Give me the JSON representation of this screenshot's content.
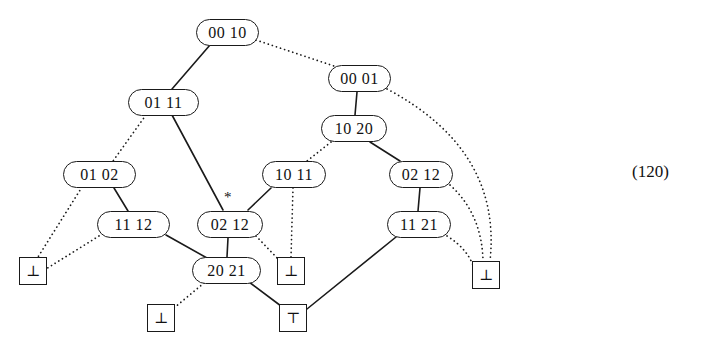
{
  "figure": {
    "equation_number": "(120)",
    "star_annotation": "*",
    "colors": {
      "background": "#ffffff",
      "ink": "#111111",
      "stroke": "#1a1a1a"
    },
    "nodes": [
      {
        "id": "n_00_10",
        "label": "00 10",
        "x": 196,
        "y": 19,
        "w": 63,
        "h": 27,
        "font_size": 16
      },
      {
        "id": "n_01_11",
        "label": "01 11",
        "x": 128,
        "y": 89,
        "w": 71,
        "h": 27,
        "font_size": 16
      },
      {
        "id": "n_00_01",
        "label": "00 01",
        "x": 328,
        "y": 65,
        "w": 63,
        "h": 27,
        "font_size": 16
      },
      {
        "id": "n_10_20",
        "label": "10 20",
        "x": 321,
        "y": 115,
        "w": 66,
        "h": 27,
        "font_size": 16
      },
      {
        "id": "n_01_02",
        "label": "01 02",
        "x": 63,
        "y": 161,
        "w": 73,
        "h": 27,
        "font_size": 16
      },
      {
        "id": "n_10_11",
        "label": "10 11",
        "x": 262,
        "y": 161,
        "w": 64,
        "h": 27,
        "font_size": 16
      },
      {
        "id": "n_02_12_r",
        "label": "02 12",
        "x": 389,
        "y": 161,
        "w": 64,
        "h": 27,
        "font_size": 16
      },
      {
        "id": "n_11_12",
        "label": "11 12",
        "x": 97,
        "y": 211,
        "w": 73,
        "h": 27,
        "font_size": 16
      },
      {
        "id": "n_02_12_l",
        "label": "02 12",
        "x": 197,
        "y": 211,
        "w": 66,
        "h": 27,
        "font_size": 16
      },
      {
        "id": "n_11_21",
        "label": "11 21",
        "x": 387,
        "y": 211,
        "w": 64,
        "h": 27,
        "font_size": 16
      },
      {
        "id": "n_20_21",
        "label": "20 21",
        "x": 192,
        "y": 257,
        "w": 69,
        "h": 27,
        "font_size": 16
      }
    ],
    "terminals": [
      {
        "id": "t_bot_1",
        "label": "⊥",
        "x": 19,
        "y": 257,
        "w": 28,
        "h": 28,
        "font_size": 15
      },
      {
        "id": "t_bot_2",
        "label": "⊥",
        "x": 277,
        "y": 257,
        "w": 28,
        "h": 28,
        "font_size": 15
      },
      {
        "id": "t_bot_3",
        "label": "⊥",
        "x": 472,
        "y": 261,
        "w": 28,
        "h": 28,
        "font_size": 15
      },
      {
        "id": "t_bot_4",
        "label": "⊥",
        "x": 147,
        "y": 304,
        "w": 28,
        "h": 28,
        "font_size": 15
      },
      {
        "id": "t_top_1",
        "label": "⊤",
        "x": 279,
        "y": 304,
        "w": 28,
        "h": 28,
        "font_size": 15
      }
    ],
    "edges": [
      {
        "from": "n_00_10",
        "to": "n_01_11",
        "style": "solid",
        "kind": "line",
        "x1": 210,
        "y1": 45,
        "x2": 172,
        "y2": 89
      },
      {
        "from": "n_00_10",
        "to": "n_00_01",
        "style": "dotted",
        "kind": "line",
        "x1": 256,
        "y1": 40,
        "x2": 334,
        "y2": 66
      },
      {
        "from": "n_01_11",
        "to": "n_01_02",
        "style": "dotted",
        "kind": "line",
        "x1": 146,
        "y1": 115,
        "x2": 113,
        "y2": 161
      },
      {
        "from": "n_01_11",
        "to": "n_02_12_l",
        "style": "solid",
        "kind": "line",
        "x1": 172,
        "y1": 115,
        "x2": 223,
        "y2": 210
      },
      {
        "from": "n_00_01",
        "to": "n_10_20",
        "style": "solid",
        "kind": "line",
        "x1": 357,
        "y1": 92,
        "x2": 355,
        "y2": 115
      },
      {
        "from": "n_00_01",
        "to": "t_bot_3",
        "style": "dotted",
        "kind": "curve",
        "x1": 387,
        "y1": 89,
        "cx": 502,
        "cy": 150,
        "x2": 490,
        "y2": 261
      },
      {
        "from": "n_10_20",
        "to": "n_10_11",
        "style": "dotted",
        "kind": "line",
        "x1": 331,
        "y1": 142,
        "x2": 307,
        "y2": 161
      },
      {
        "from": "n_10_20",
        "to": "n_02_12_r",
        "style": "solid",
        "kind": "line",
        "x1": 370,
        "y1": 142,
        "x2": 400,
        "y2": 161
      },
      {
        "from": "n_01_02",
        "to": "t_bot_1",
        "style": "dotted",
        "kind": "line",
        "x1": 82,
        "y1": 187,
        "x2": 38,
        "y2": 257
      },
      {
        "from": "n_01_02",
        "to": "n_11_12",
        "style": "solid",
        "kind": "line",
        "x1": 114,
        "y1": 188,
        "x2": 128,
        "y2": 211
      },
      {
        "from": "n_10_11",
        "to": "n_02_12_l",
        "style": "solid",
        "kind": "line",
        "x1": 271,
        "y1": 188,
        "x2": 248,
        "y2": 210
      },
      {
        "from": "n_10_11",
        "to": "t_bot_2",
        "style": "dotted",
        "kind": "line",
        "x1": 293,
        "y1": 188,
        "x2": 291,
        "y2": 257
      },
      {
        "from": "n_02_12_r",
        "to": "n_11_21",
        "style": "solid",
        "kind": "line",
        "x1": 420,
        "y1": 188,
        "x2": 418,
        "y2": 211
      },
      {
        "from": "n_02_12_r",
        "to": "t_bot_3",
        "style": "dotted",
        "kind": "curve",
        "x1": 450,
        "y1": 185,
        "cx": 482,
        "cy": 214,
        "x2": 483,
        "y2": 261
      },
      {
        "from": "n_11_12",
        "to": "t_bot_1",
        "style": "dotted",
        "kind": "line",
        "x1": 99,
        "y1": 236,
        "x2": 46,
        "y2": 269
      },
      {
        "from": "n_11_12",
        "to": "n_20_21",
        "style": "solid",
        "kind": "line",
        "x1": 166,
        "y1": 235,
        "x2": 207,
        "y2": 258
      },
      {
        "from": "n_02_12_l",
        "to": "n_20_21",
        "style": "solid",
        "kind": "line",
        "x1": 228,
        "y1": 238,
        "x2": 227,
        "y2": 257
      },
      {
        "from": "n_02_12_l",
        "to": "t_bot_2",
        "style": "dotted",
        "kind": "line",
        "x1": 256,
        "y1": 236,
        "x2": 279,
        "y2": 260
      },
      {
        "from": "n_11_21",
        "to": "t_top_1",
        "style": "solid",
        "kind": "line",
        "x1": 396,
        "y1": 237,
        "x2": 307,
        "y2": 309
      },
      {
        "from": "n_11_21",
        "to": "t_bot_3",
        "style": "dotted",
        "kind": "curve",
        "x1": 447,
        "y1": 236,
        "cx": 468,
        "cy": 249,
        "x2": 474,
        "y2": 268
      },
      {
        "from": "n_20_21",
        "to": "t_bot_4",
        "style": "dotted",
        "kind": "line",
        "x1": 204,
        "y1": 283,
        "x2": 174,
        "y2": 308
      },
      {
        "from": "n_20_21",
        "to": "t_top_1",
        "style": "solid",
        "kind": "line",
        "x1": 249,
        "y1": 282,
        "x2": 281,
        "y2": 306
      }
    ],
    "star": {
      "x": 224,
      "y": 190
    },
    "equation_label": {
      "x": 632,
      "y": 162
    }
  }
}
